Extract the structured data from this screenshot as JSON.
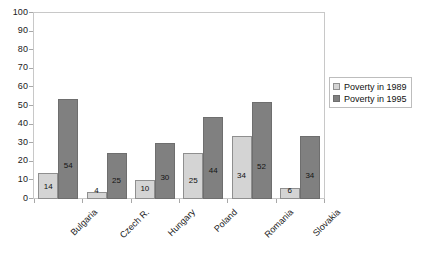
{
  "chart_data": {
    "type": "bar",
    "title": "",
    "subtitle": "",
    "xlabel": "",
    "ylabel": "",
    "ylim": [
      0,
      100
    ],
    "yticks": [
      0,
      10,
      20,
      30,
      40,
      50,
      60,
      70,
      80,
      90,
      100
    ],
    "grid": false,
    "legend_position": "right",
    "categories": [
      "Bulgaria",
      "Czech R.",
      "Hungary",
      "Poland",
      "Romania",
      "Slovakia"
    ],
    "series": [
      {
        "name": "Poverty in 1989",
        "color": "#d4d4d4",
        "values": [
          14,
          4,
          10,
          25,
          34,
          6
        ]
      },
      {
        "name": "Poverty in 1995",
        "color": "#808080",
        "values": [
          54,
          25,
          30,
          44,
          52,
          34
        ]
      }
    ]
  },
  "legend": {
    "items": [
      {
        "label": "Poverty in 1989",
        "swatch": "light-gray"
      },
      {
        "label": "Poverty in 1995",
        "swatch": "dark-gray"
      }
    ]
  },
  "axis": {
    "y_tick_labels": [
      "100",
      "90",
      "80",
      "70",
      "60",
      "50",
      "40",
      "30",
      "20",
      "10",
      "0"
    ],
    "x_tick_labels": [
      "Bulgaria",
      "Czech R.",
      "Hungary",
      "Poland",
      "Romania",
      "Slovakia"
    ]
  },
  "data_labels": {
    "series_1": [
      "14",
      "4",
      "10",
      "25",
      "34",
      "6"
    ],
    "series_2": [
      "54",
      "25",
      "30",
      "44",
      "52",
      "34"
    ]
  },
  "colors": {
    "series_1": "#d4d4d4",
    "series_2": "#808080",
    "frame": "#c8c8c8",
    "background": "#ffffff"
  }
}
